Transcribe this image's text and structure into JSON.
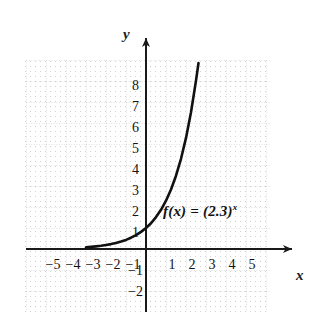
{
  "figure": {
    "function_label_main": "f(x) = (2.3)",
    "function_label_exponent": "x",
    "axis_x_name": "x",
    "axis_y_name": "y",
    "curve_color": "#111111",
    "grid_color": "#c9c9c9",
    "axis_color": "#1a1a1a",
    "background_color": "#ffffff"
  },
  "chart_data": {
    "type": "line",
    "title": "",
    "subtitle": "",
    "xlabel": "x",
    "ylabel": "y",
    "legend": [
      "f(x) = (2.3)^x"
    ],
    "legend_position": "inline-annotation",
    "annotations": [
      {
        "text": "f(x) = (2.3)^x",
        "x": 0.9,
        "y": 1.6
      }
    ],
    "grid": true,
    "grid_style": "dotted",
    "xlim": [
      -5.9,
      7.4
    ],
    "ylim": [
      -2.9,
      9.2
    ],
    "x_ticks": [
      -5,
      -4,
      -3,
      -2,
      -1,
      1,
      2,
      3,
      4,
      5
    ],
    "x_tick_labels": [
      "−5",
      "−4",
      "−3",
      "−2",
      "−1",
      "1",
      "2",
      "3",
      "4",
      "5"
    ],
    "y_ticks": [
      -2,
      -1,
      1,
      2,
      3,
      4,
      5,
      6,
      7,
      8
    ],
    "y_tick_labels": [
      "−2",
      "−1",
      "1",
      "2",
      "3",
      "4",
      "5",
      "6",
      "7",
      "8"
    ],
    "series": [
      {
        "name": "f(x) = (2.3)^x",
        "base": 2.3,
        "expression": "(2.3)^x",
        "x": [
          -3.0,
          -2.75,
          -2.5,
          -2.25,
          -2.0,
          -1.75,
          -1.5,
          -1.25,
          -1.0,
          -0.75,
          -0.5,
          -0.25,
          0.0,
          0.25,
          0.5,
          0.75,
          1.0,
          1.25,
          1.5,
          1.75,
          2.0,
          2.25,
          2.5,
          2.6
        ],
        "values": [
          0.082,
          0.1,
          0.124,
          0.153,
          0.189,
          0.233,
          0.287,
          0.354,
          0.435,
          0.536,
          0.659,
          0.812,
          1.0,
          1.231,
          1.517,
          1.867,
          2.3,
          2.832,
          3.488,
          4.294,
          5.29,
          6.513,
          8.021,
          8.75
        ]
      }
    ],
    "notable_points": [
      {
        "x": 0,
        "y": 1,
        "note": "y-intercept"
      },
      {
        "x": 1,
        "y": 2.3,
        "note": "base value"
      }
    ],
    "asymptote": {
      "type": "horizontal",
      "y": 0
    }
  },
  "x_tick_positions": [
    {
      "label": "−5",
      "px": 45,
      "py": 258
    },
    {
      "label": "−4",
      "px": 65,
      "py": 258
    },
    {
      "label": "−3",
      "px": 85,
      "py": 258
    },
    {
      "label": "−2",
      "px": 105,
      "py": 258
    },
    {
      "label": "−1",
      "px": 125,
      "py": 258
    },
    {
      "label": "1",
      "px": 164,
      "py": 258
    },
    {
      "label": "2",
      "px": 184,
      "py": 258
    },
    {
      "label": "3",
      "px": 204,
      "py": 258
    },
    {
      "label": "4",
      "px": 224,
      "py": 258
    },
    {
      "label": "5",
      "px": 244,
      "py": 258
    }
  ],
  "y_tick_positions": [
    {
      "label": "8",
      "px": 123,
      "py": 79
    },
    {
      "label": "7",
      "px": 123,
      "py": 100
    },
    {
      "label": "6",
      "px": 123,
      "py": 121
    },
    {
      "label": "5",
      "px": 123,
      "py": 142
    },
    {
      "label": "4",
      "px": 123,
      "py": 163
    },
    {
      "label": "3",
      "px": 123,
      "py": 184
    },
    {
      "label": "2",
      "px": 123,
      "py": 205
    },
    {
      "label": "1",
      "px": 123,
      "py": 226
    },
    {
      "label": "−1",
      "px": 127,
      "py": 264
    },
    {
      "label": "−2",
      "px": 127,
      "py": 285
    }
  ]
}
